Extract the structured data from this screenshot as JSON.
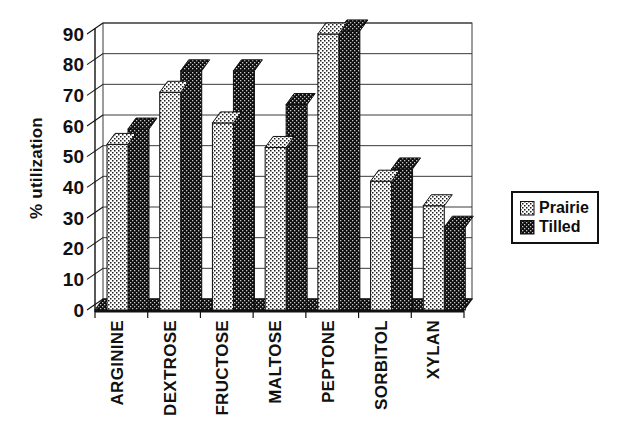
{
  "axis": {
    "y_title": "% utilization"
  },
  "legend": {
    "items": [
      {
        "label": "Prairie",
        "pattern": "light-stipple"
      },
      {
        "label": "Tilled",
        "pattern": "dark-checker"
      }
    ]
  },
  "chart_data": {
    "type": "bar",
    "style": "3d-effect-grouped-bars, scanned black-and-white figure",
    "title": "",
    "xlabel": "",
    "ylabel": "% utilization",
    "categories": [
      "ARGININE",
      "DEXTROSE",
      "FRUCTOSE",
      "MALTOSE",
      "PEPTONE",
      "SORBITOL",
      "XYLAN"
    ],
    "series": [
      {
        "name": "Prairie",
        "pattern": "light-stipple",
        "values": [
          54,
          71,
          61,
          53,
          90,
          42,
          34
        ]
      },
      {
        "name": "Tilled",
        "pattern": "dark-checker",
        "values": [
          59,
          78,
          78,
          67,
          91,
          46,
          27
        ]
      }
    ],
    "ylim": [
      0,
      90
    ],
    "yticks": [
      0,
      10,
      20,
      30,
      40,
      50,
      60,
      70,
      80,
      90
    ],
    "grid": true,
    "legend_position": "right",
    "colors": {
      "ink": "#111111",
      "paper": "#ffffff",
      "grid": "#3a3a3a"
    }
  }
}
